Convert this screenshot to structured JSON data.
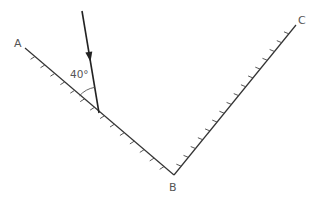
{
  "diagram": {
    "points": {
      "A": {
        "label": "A",
        "x": 25,
        "y": 48
      },
      "B": {
        "label": "B",
        "x": 174,
        "y": 175
      },
      "C": {
        "label": "C",
        "x": 296,
        "y": 25
      }
    },
    "mirrors": [
      {
        "name": "mirror-AB",
        "from": "A",
        "to": "B",
        "hatch_count": 14
      },
      {
        "name": "mirror-BC",
        "from": "B",
        "to": "C",
        "hatch_count": 16
      }
    ],
    "incident_ray": {
      "start": {
        "x": 82,
        "y": 11
      },
      "end": {
        "x": 99,
        "y": 113
      },
      "arrow_at": 0.45
    },
    "angle": {
      "label": "40°",
      "between": "incident ray and mirror AB"
    },
    "colors": {
      "line": "#333333",
      "text": "#555555",
      "background": "#ffffff"
    }
  }
}
